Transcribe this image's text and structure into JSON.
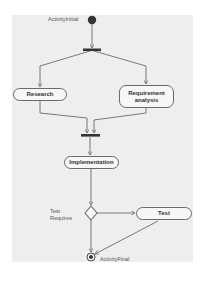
{
  "diagram": {
    "type": "UML activity diagram",
    "initial_node": {
      "label": "ActivityInitial"
    },
    "final_node": {
      "label": "ActivityFinal"
    },
    "actions": [
      {
        "id": "research",
        "label": "Research"
      },
      {
        "id": "requirement-analysis",
        "label": "Requirement analysis"
      },
      {
        "id": "implementation",
        "label": "Implementation"
      },
      {
        "id": "test",
        "label": "Test"
      }
    ],
    "decision": {
      "guard_label": "Test Requires"
    },
    "bars": [
      {
        "id": "fork",
        "kind": "fork"
      },
      {
        "id": "join",
        "kind": "join"
      }
    ],
    "flows": [
      [
        "ActivityInitial",
        "fork"
      ],
      [
        "fork",
        "Research"
      ],
      [
        "fork",
        "Requirement analysis"
      ],
      [
        "Research",
        "join"
      ],
      [
        "Requirement analysis",
        "join"
      ],
      [
        "join",
        "Implementation"
      ],
      [
        "Implementation",
        "decision"
      ],
      [
        "decision",
        "Test"
      ],
      [
        "decision",
        "ActivityFinal"
      ],
      [
        "Test",
        "ActivityFinal"
      ]
    ],
    "colors": {
      "background": "#eeeeee",
      "stroke": "#6a6a6a",
      "node_fill": "#f7f7f7",
      "solid": "#333333"
    }
  }
}
